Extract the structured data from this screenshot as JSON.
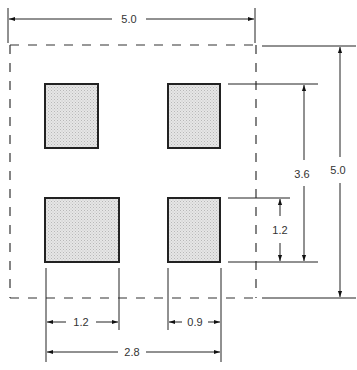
{
  "colors": {
    "line": "#222222",
    "pad_fill": "#e2e2e2",
    "background": "#ffffff"
  },
  "outline": {
    "style": "dashed",
    "width": 5.0,
    "height": 5.0
  },
  "pads": [
    {
      "id": "top-left",
      "position": "upper-left"
    },
    {
      "id": "top-right",
      "position": "upper-right"
    },
    {
      "id": "bottom-left",
      "position": "lower-left"
    },
    {
      "id": "bottom-right",
      "position": "lower-right"
    }
  ],
  "dimensions": {
    "overall_width": "5.0",
    "overall_height": "5.0",
    "pad_pitch_vertical": "3.6",
    "pad_height": "1.2",
    "pad_width_left": "1.2",
    "pad_width_right": "0.9",
    "pad_span_horizontal": "2.8"
  }
}
